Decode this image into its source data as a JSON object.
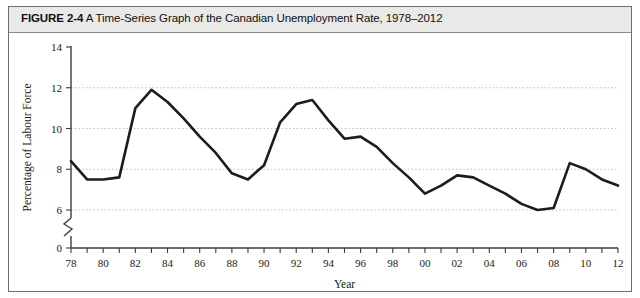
{
  "figure": {
    "number": "FIGURE 2-4",
    "caption": "A Time-Series Graph of the Canadian Unemployment Rate, 1978–2012"
  },
  "chart_data": {
    "type": "line",
    "title": "A Time-Series Graph of the Canadian Unemployment Rate, 1978–2012",
    "xlabel": "Year",
    "ylabel": "Percentage of Labour Force",
    "xlim": [
      1978,
      2012
    ],
    "ylim": [
      0,
      14
    ],
    "y_axis_break": true,
    "y_break_between": [
      0,
      6
    ],
    "grid": true,
    "gridlines": [
      6,
      8,
      10,
      12
    ],
    "legend": "none",
    "y_ticklabels": [
      "0",
      "6",
      "8",
      "10",
      "12",
      "14"
    ],
    "y_tickvalues": [
      0,
      6,
      8,
      10,
      12,
      14
    ],
    "x_ticklabels": [
      "78",
      "80",
      "82",
      "84",
      "86",
      "88",
      "90",
      "92",
      "94",
      "96",
      "98",
      "00",
      "02",
      "04",
      "06",
      "08",
      "10",
      "12"
    ],
    "x_tickvalues": [
      1978,
      1980,
      1982,
      1984,
      1986,
      1988,
      1990,
      1992,
      1994,
      1996,
      1998,
      2000,
      2002,
      2004,
      2006,
      2008,
      2010,
      2012
    ],
    "x_minor_tick_interval": 1,
    "series": [
      {
        "name": "Canadian Unemployment Rate",
        "color": "#1c1c1c",
        "x": [
          1978,
          1979,
          1980,
          1981,
          1982,
          1983,
          1984,
          1985,
          1986,
          1987,
          1988,
          1989,
          1990,
          1991,
          1992,
          1993,
          1994,
          1995,
          1996,
          1997,
          1998,
          1999,
          2000,
          2001,
          2002,
          2003,
          2004,
          2005,
          2006,
          2007,
          2008,
          2009,
          2010,
          2011,
          2012
        ],
        "values": [
          8.4,
          7.5,
          7.5,
          7.6,
          11.0,
          11.9,
          11.3,
          10.5,
          9.6,
          8.8,
          7.8,
          7.5,
          8.2,
          10.3,
          11.2,
          11.4,
          10.4,
          9.5,
          9.6,
          9.1,
          8.3,
          7.6,
          6.8,
          7.2,
          7.7,
          7.6,
          7.2,
          6.8,
          6.3,
          6.0,
          6.1,
          8.3,
          8.0,
          7.5,
          7.2
        ]
      }
    ]
  }
}
